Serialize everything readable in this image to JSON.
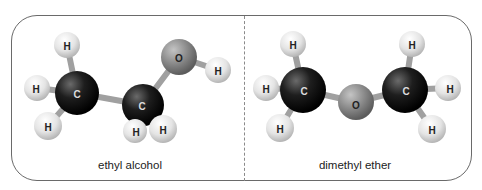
{
  "panels": [
    {
      "caption": "ethyl alcohol",
      "atoms": [
        {
          "id": "C1",
          "label": "C",
          "x": 77,
          "y": 93,
          "r": 22,
          "type": "carbon"
        },
        {
          "id": "C2",
          "label": "C",
          "x": 143,
          "y": 105,
          "r": 21,
          "type": "carbon"
        },
        {
          "id": "O1",
          "label": "O",
          "x": 179,
          "y": 57,
          "r": 18,
          "type": "oxygen"
        },
        {
          "id": "H1",
          "label": "H",
          "x": 67,
          "y": 45,
          "r": 13,
          "type": "hydrogen"
        },
        {
          "id": "H2",
          "label": "H",
          "x": 37,
          "y": 88,
          "r": 13,
          "type": "hydrogen"
        },
        {
          "id": "H3",
          "label": "H",
          "x": 48,
          "y": 126,
          "r": 14,
          "type": "hydrogen"
        },
        {
          "id": "H4",
          "label": "H",
          "x": 135,
          "y": 131,
          "r": 12,
          "type": "hydrogen"
        },
        {
          "id": "H5",
          "label": "H",
          "x": 163,
          "y": 129,
          "r": 14,
          "type": "hydrogen"
        },
        {
          "id": "H6",
          "label": "H",
          "x": 218,
          "y": 70,
          "r": 13,
          "type": "hydrogen"
        }
      ]
    },
    {
      "caption": "dimethyl ether",
      "atoms": [
        {
          "id": "C1",
          "label": "C",
          "x": 303,
          "y": 90,
          "r": 23,
          "type": "carbon"
        },
        {
          "id": "O1",
          "label": "O",
          "x": 356,
          "y": 102,
          "r": 18,
          "type": "oxygen"
        },
        {
          "id": "C2",
          "label": "C",
          "x": 405,
          "y": 90,
          "r": 23,
          "type": "carbon"
        },
        {
          "id": "H1",
          "label": "H",
          "x": 293,
          "y": 44,
          "r": 13,
          "type": "hydrogen"
        },
        {
          "id": "H2",
          "label": "H",
          "x": 266,
          "y": 88,
          "r": 13,
          "type": "hydrogen"
        },
        {
          "id": "H3",
          "label": "H",
          "x": 280,
          "y": 128,
          "r": 14,
          "type": "hydrogen"
        },
        {
          "id": "H4",
          "label": "H",
          "x": 412,
          "y": 44,
          "r": 13,
          "type": "hydrogen"
        },
        {
          "id": "H5",
          "label": "H",
          "x": 448,
          "y": 88,
          "r": 13,
          "type": "hydrogen"
        },
        {
          "id": "H6",
          "label": "H",
          "x": 432,
          "y": 129,
          "r": 14,
          "type": "hydrogen"
        }
      ]
    }
  ],
  "colors": {
    "frame": "#6a6a6a",
    "carbon": "#151515",
    "oxygen": "#8a8a8a",
    "hydrogen": "#e6e6e6",
    "bond": "#9a9a9a"
  }
}
